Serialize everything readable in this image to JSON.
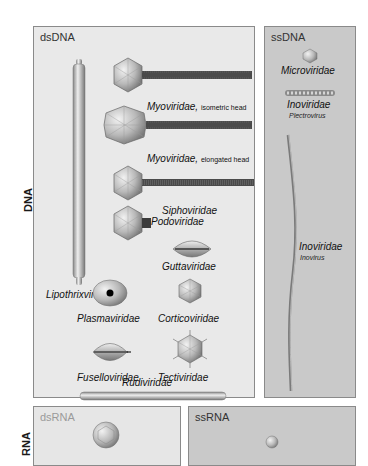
{
  "row_labels": {
    "dna": "DNA",
    "rna": "RNA"
  },
  "panels": {
    "dsDNA": {
      "label": "dsDNA",
      "families": {
        "myo_iso": {
          "name": "Myoviridae,",
          "note": "isometric head"
        },
        "myo_elong": {
          "name": "Myoviridae,",
          "note": "elongated head"
        },
        "sipho": {
          "name": "Siphoviridae"
        },
        "podo": {
          "name": "Podoviridae"
        },
        "lipo": {
          "name": "Lipothrixviridae"
        },
        "gutta": {
          "name": "Guttaviridae"
        },
        "plasma": {
          "name": "Plasmaviridae"
        },
        "cortico": {
          "name": "Corticoviridae"
        },
        "fusello": {
          "name": "Fuselloviridae"
        },
        "tecti": {
          "name": "Tectiviridae"
        },
        "rudi": {
          "name": "Rudiviridae"
        }
      }
    },
    "ssDNA": {
      "label": "ssDNA",
      "families": {
        "micro": {
          "name": "Microviridae"
        },
        "ino_plectro": {
          "name": "Inoviridae",
          "genus": "Plectrovirus"
        },
        "ino_ino": {
          "name": "Inoviridae",
          "genus": "Inovirus"
        }
      }
    },
    "dsRNA": {
      "label": "dsRNA"
    },
    "ssRNA": {
      "label": "ssRNA"
    }
  },
  "colors": {
    "ds_bg": "#e9e9e9",
    "ss_bg": "#c9c9c9",
    "border": "#8a8a8a",
    "tail": "#555555"
  }
}
